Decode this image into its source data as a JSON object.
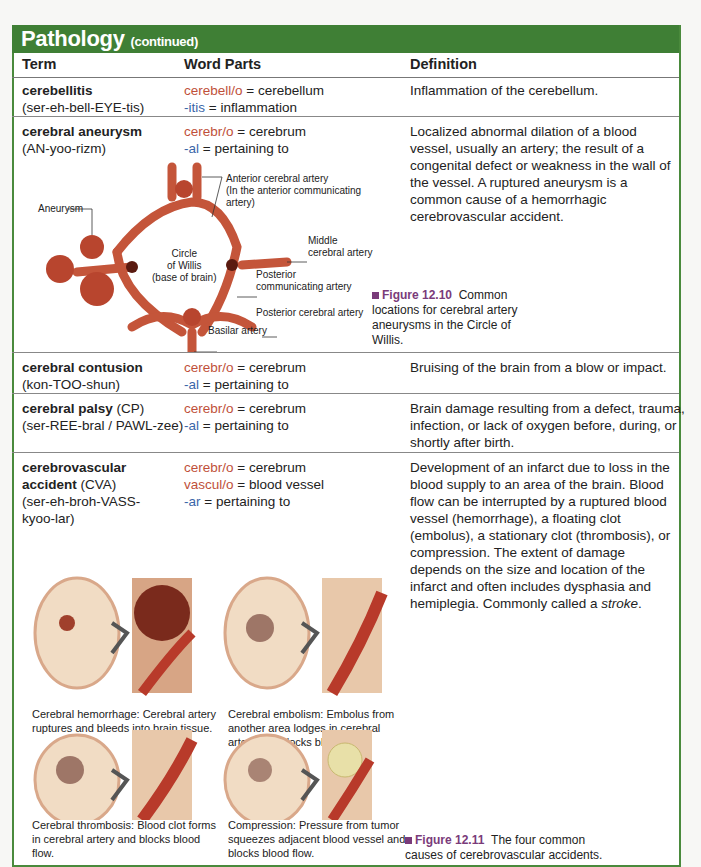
{
  "section": {
    "title": "Pathology",
    "subtitle": "(continued)"
  },
  "colors": {
    "banner": "#3f7f35",
    "combining_form": "#c0503a",
    "suffix": "#3a66a8",
    "figure_label": "#7a3b7a"
  },
  "table": {
    "headers": [
      "Term",
      "Word Parts",
      "Definition"
    ],
    "rows": [
      {
        "term": "cerebellitis",
        "pron": "(ser-eh-bell-EYE-tis)",
        "parts": [
          {
            "part": "cerebell/o",
            "meaning": " = cerebellum"
          },
          {
            "part": "-itis",
            "meaning": " = inflammation"
          }
        ],
        "definition": "Inflammation of the cerebellum."
      },
      {
        "term": "cerebral aneurysm",
        "pron": "(AN-yoo-rizm)",
        "parts": [
          {
            "part": "cerebr/o",
            "meaning": " = cerebrum"
          },
          {
            "part": "-al",
            "meaning": " = pertaining to"
          }
        ],
        "definition": "Localized abnormal dilation of a blood vessel, usually an artery; the result of a congenital defect or weakness in the wall of the vessel. A ruptured aneurysm is a common cause of a hemorrhagic cerebrovascular accident."
      },
      {
        "term": "cerebral contusion",
        "pron": "(kon-TOO-shun)",
        "parts": [
          {
            "part": "cerebr/o",
            "meaning": " = cerebrum"
          },
          {
            "part": "-al",
            "meaning": " = pertaining to"
          }
        ],
        "definition": "Bruising of the brain from a blow or impact."
      },
      {
        "term": "cerebral palsy",
        "abbr": " (CP)",
        "pron": "(ser-REE-bral / PAWL-zee)",
        "parts": [
          {
            "part": "cerebr/o",
            "meaning": " = cerebrum"
          },
          {
            "part": "-al",
            "meaning": " = pertaining to"
          }
        ],
        "definition": "Brain damage resulting from a defect, trauma, infection, or lack of oxygen before, during, or shortly after birth."
      },
      {
        "term1": "cerebrovascular",
        "term2": "accident",
        "abbr": " (CVA)",
        "pron1": "(ser-eh-broh-VASS-",
        "pron2": "kyoo-lar)",
        "parts": [
          {
            "part": "cerebr/o",
            "meaning": " = cerebrum"
          },
          {
            "part": "vascul/o",
            "meaning": " = blood vessel"
          },
          {
            "part": "-ar",
            "meaning": " = pertaining to"
          }
        ],
        "definition": "Development of an infarct due to loss in the blood supply to an area of the brain. Blood flow can be interrupted by a ruptured blood vessel (hemorrhage), a floating clot (embolus), a stationary clot (thrombosis), or compression. The extent of damage depends on the size and location of the infarct and often includes dysphasia and hemiplegia. Commonly called a ",
        "definition_italic": "stroke",
        "definition_end": "."
      }
    ]
  },
  "figure_12_10": {
    "label": "Figure 12.10",
    "caption": "Common locations for cerebral artery aneurysms in the Circle of Willis.",
    "labels": {
      "aneurysm": "Aneurysm",
      "anterior": "Anterior cerebral artery",
      "anterior2": "(In the anterior communicating",
      "anterior3": "artery)",
      "middle1": "Middle",
      "middle2": "cerebral artery",
      "circle1": "Circle",
      "circle2": "of Willis",
      "circle3": "(base of brain)",
      "postcomm1": "Posterior",
      "postcomm2": "communicating artery",
      "postcereb": "Posterior cerebral artery",
      "basilar": "Basilar artery"
    }
  },
  "figure_12_11": {
    "label": "Figure 12.11",
    "caption": "The four common causes of cerebrovascular accidents.",
    "panels": [
      "Cerebral hemorrhage: Cerebral artery ruptures and bleeds into brain tissue.",
      "Cerebral embolism: Embolus from another area lodges in cerebral artery and blocks blood flow.",
      "Cerebral thrombosis: Blood clot forms in cerebral artery and blocks blood flow.",
      "Compression: Pressure from tumor squeezes adjacent blood vessel and blocks blood flow."
    ]
  }
}
